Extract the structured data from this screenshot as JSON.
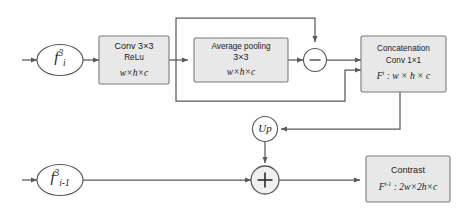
{
  "figure": {
    "background": "#ffffff",
    "line_color": "#5a5a5a",
    "box_fill": "#e8e8e8",
    "box_stroke": "#7a7a7a",
    "text_color": "#1a1a1a"
  },
  "nodes": {
    "input_top": {
      "name": "f-i-3",
      "base": "f",
      "sub": "i",
      "sup": "3"
    },
    "input_bottom": {
      "name": "f-i-minus-1-3",
      "base": "f",
      "sub": "i-1",
      "sup": "3"
    },
    "conv": {
      "title": "Conv 3×3",
      "sub": "ReLu",
      "dim": "w×h×c"
    },
    "avgpool": {
      "title": "Average pooling",
      "sub": "3×3",
      "dim": "w×h×c"
    },
    "subtract": {
      "symbol": "−",
      "label": "minus"
    },
    "concat": {
      "title": "Concatenation",
      "sub": "Conv  1×1",
      "dim_base": "F",
      "dim_sup": "i",
      "dim_rest": " : w × h × c"
    },
    "upsample": {
      "label": "Up"
    },
    "add": {
      "symbol": "+",
      "label": "plus"
    },
    "contrast": {
      "title": "Contrast",
      "dim_base": "F",
      "dim_sup": "i-1",
      "dim_rest": " : 2w×2h×c"
    }
  }
}
